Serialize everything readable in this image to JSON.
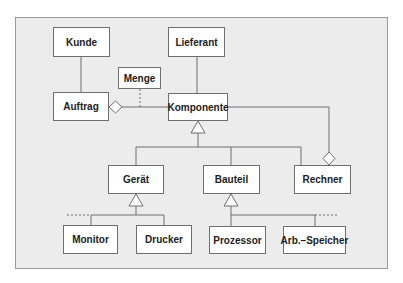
{
  "diagram": {
    "type": "uml-class-diagram",
    "classes": {
      "kunde": "Kunde",
      "lieferant": "Lieferant",
      "menge": "Menge",
      "auftrag": "Auftrag",
      "komponente": "Komponente",
      "geraet": "Gerät",
      "bauteil": "Bauteil",
      "rechner": "Rechner",
      "monitor": "Monitor",
      "drucker": "Drucker",
      "prozessor": "Prozessor",
      "arbeitsspeicher": "Arb.–Speicher"
    },
    "relations": [
      {
        "kind": "association",
        "from": "Kunde",
        "to": "Auftrag"
      },
      {
        "kind": "association",
        "from": "Lieferant",
        "to": "Komponente"
      },
      {
        "kind": "aggregation",
        "whole": "Auftrag",
        "part": "Komponente"
      },
      {
        "kind": "association-class",
        "class": "Menge",
        "on": "Auftrag–Komponente"
      },
      {
        "kind": "generalization",
        "parent": "Komponente",
        "children": [
          "Gerät",
          "Bauteil",
          "Rechner"
        ]
      },
      {
        "kind": "aggregation",
        "whole": "Rechner",
        "part": "Komponente"
      },
      {
        "kind": "generalization",
        "parent": "Gerät",
        "children": [
          "Monitor",
          "Drucker"
        ],
        "incomplete": true
      },
      {
        "kind": "generalization",
        "parent": "Bauteil",
        "children": [
          "Prozessor",
          "Arb.–Speicher"
        ],
        "incomplete": true
      }
    ]
  }
}
